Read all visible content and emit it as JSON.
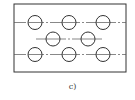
{
  "figure": {
    "caption": "c)",
    "stroke_color": "#333333",
    "frame": {
      "x": 14,
      "y": 4,
      "width": 112,
      "height": 68
    },
    "circle_radius": 7,
    "rows": [
      {
        "y": 22.5,
        "line_x1": 14,
        "line_x2": 126,
        "circles_x": [
          35,
          69,
          103
        ]
      },
      {
        "y": 39,
        "line_x1": 36,
        "line_x2": 104,
        "circles_x": [
          53,
          87
        ]
      },
      {
        "y": 54.5,
        "line_x1": 14,
        "line_x2": 126,
        "circles_x": [
          35,
          69,
          103
        ]
      }
    ]
  }
}
